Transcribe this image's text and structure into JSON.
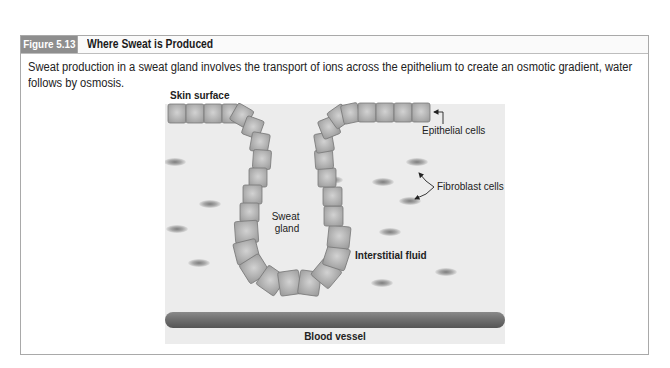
{
  "figure": {
    "number": "Figure 5.13",
    "title": "Where Sweat is Produced",
    "caption": "Sweat production in a sweat gland involves the transport of ions across the epithelium to create an osmotic gradient, water follows by osmosis."
  },
  "diagram": {
    "labels": {
      "skin_surface": "Skin surface",
      "epithelial_cells": "Epithelial cells",
      "fibroblast_cells": "Fibroblast cells",
      "sweat_gland_line1": "Sweat",
      "sweat_gland_line2": "gland",
      "interstitial_fluid": "Interstitial fluid",
      "blood_vessel": "Blood vessel"
    },
    "colors": {
      "panel_bg": "#ececec",
      "cell_fill": "#b9b9b9",
      "cell_stroke": "#7a7a7a",
      "vessel": "#6e6e6e",
      "fibroblast": "#8c8c8c",
      "header_box": "#8e8e8e"
    }
  }
}
